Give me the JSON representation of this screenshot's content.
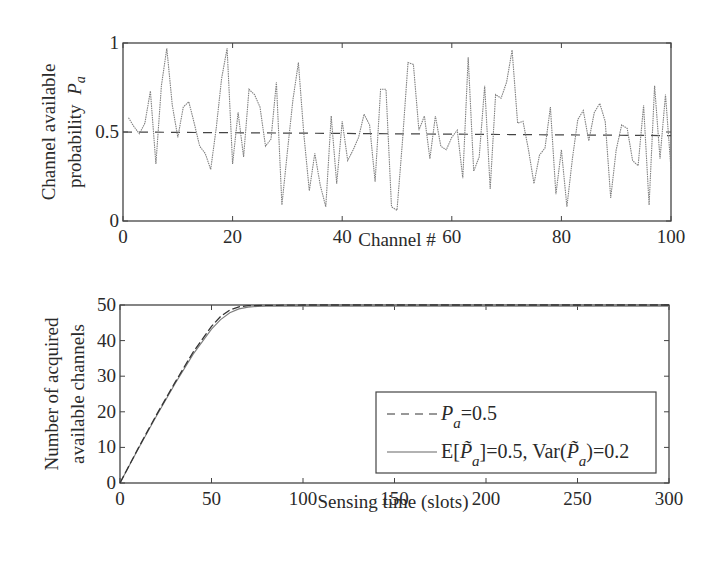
{
  "chart_data": [
    {
      "type": "line",
      "title": "",
      "xlabel": "Channel #",
      "ylabel_line1": "Channel available",
      "ylabel_line2": "probability",
      "ylabel_symbol": "P",
      "ylabel_subscript": "a",
      "xlim": [
        0,
        100
      ],
      "ylim": [
        0,
        1
      ],
      "xticks": [
        0,
        20,
        40,
        60,
        80,
        100
      ],
      "xtick_labels": [
        "0",
        "20",
        "40",
        "60",
        "80",
        "100"
      ],
      "yticks": [
        0,
        0.5,
        1
      ],
      "ytick_labels": [
        "0",
        "0.5",
        "1"
      ],
      "grid": false,
      "series": [
        {
          "name": "Random channel available probability",
          "style": "dotted",
          "color": "#7a7a7a",
          "x": [
            1,
            2,
            3,
            4,
            5,
            6,
            7,
            8,
            9,
            10,
            11,
            12,
            13,
            14,
            15,
            16,
            17,
            18,
            19,
            20,
            21,
            22,
            23,
            24,
            25,
            26,
            27,
            28,
            29,
            30,
            31,
            32,
            33,
            34,
            35,
            36,
            37,
            38,
            39,
            40,
            41,
            42,
            43,
            44,
            45,
            46,
            47,
            48,
            49,
            50,
            51,
            52,
            53,
            54,
            55,
            56,
            57,
            58,
            59,
            60,
            61,
            62,
            63,
            64,
            65,
            66,
            67,
            68,
            69,
            70,
            71,
            72,
            73,
            74,
            75,
            76,
            77,
            78,
            79,
            80,
            81,
            82,
            83,
            84,
            85,
            86,
            87,
            88,
            89,
            90,
            91,
            92,
            93,
            94,
            95,
            96,
            97,
            98,
            99,
            100
          ],
          "values": [
            0.58,
            0.53,
            0.49,
            0.55,
            0.73,
            0.32,
            0.76,
            0.97,
            0.65,
            0.47,
            0.64,
            0.67,
            0.55,
            0.42,
            0.38,
            0.29,
            0.52,
            0.8,
            0.97,
            0.32,
            0.61,
            0.36,
            0.74,
            0.71,
            0.64,
            0.42,
            0.46,
            0.78,
            0.09,
            0.39,
            0.68,
            0.89,
            0.49,
            0.17,
            0.38,
            0.2,
            0.08,
            0.59,
            0.21,
            0.56,
            0.34,
            0.4,
            0.47,
            0.6,
            0.54,
            0.22,
            0.74,
            0.74,
            0.08,
            0.06,
            0.45,
            0.89,
            0.88,
            0.51,
            0.59,
            0.35,
            0.59,
            0.42,
            0.4,
            0.47,
            0.51,
            0.24,
            0.92,
            0.28,
            0.36,
            0.76,
            0.18,
            0.71,
            0.69,
            0.78,
            0.96,
            0.55,
            0.56,
            0.4,
            0.21,
            0.37,
            0.41,
            0.64,
            0.15,
            0.4,
            0.08,
            0.35,
            0.57,
            0.62,
            0.45,
            0.61,
            0.66,
            0.56,
            0.13,
            0.4,
            0.54,
            0.52,
            0.34,
            0.31,
            0.65,
            0.09,
            0.76,
            0.35,
            0.71,
            0.29
          ]
        },
        {
          "name": "Mean P_a = 0.5",
          "style": "dashed",
          "color": "#444444",
          "x": [
            0,
            100
          ],
          "values": [
            0.5,
            0.48
          ]
        }
      ]
    },
    {
      "type": "line",
      "title": "",
      "xlabel": "Sensing time (slots)",
      "ylabel_line1": "Number of acquired",
      "ylabel_line2": "available channels",
      "xlim": [
        0,
        300
      ],
      "ylim": [
        0,
        50
      ],
      "xticks": [
        0,
        50,
        100,
        150,
        200,
        250,
        300
      ],
      "xtick_labels": [
        "0",
        "50",
        "100",
        "150",
        "200",
        "250",
        "300"
      ],
      "yticks": [
        0,
        10,
        20,
        30,
        40,
        50
      ],
      "ytick_labels": [
        "0",
        "10",
        "20",
        "30",
        "40",
        "50"
      ],
      "grid": false,
      "legend_position": "lower right",
      "legend": [
        {
          "label_prefix": "P",
          "label_sub": "a",
          "label_suffix": "=0.5",
          "style": "dashed"
        },
        {
          "label_prefix": "E[",
          "label_sym": "P̃",
          "label_sub": "a",
          "label_mid": "]=0.5, Var(",
          "label_sym2": "P̃",
          "label_sub2": "a",
          "label_suffix": ")=0.2",
          "style": "solid"
        }
      ],
      "series": [
        {
          "name": "P_a=0.5",
          "style": "dashed",
          "color": "#333333",
          "x": [
            0,
            10,
            20,
            30,
            40,
            50,
            55,
            60,
            65,
            70,
            80,
            100,
            150,
            200,
            250,
            300
          ],
          "values": [
            0,
            9.8,
            19.2,
            28.2,
            36.8,
            44.0,
            46.8,
            48.6,
            49.5,
            49.8,
            49.9,
            50,
            50,
            50,
            50,
            50
          ]
        },
        {
          "name": "E[P̃_a]=0.5, Var(P̃_a)=0.2",
          "style": "solid",
          "color": "#777777",
          "x": [
            0,
            10,
            20,
            30,
            40,
            50,
            55,
            60,
            65,
            70,
            75,
            80,
            100,
            150,
            200,
            250,
            300
          ],
          "values": [
            0,
            9.6,
            18.9,
            27.8,
            36.2,
            43.2,
            45.9,
            47.8,
            48.9,
            49.4,
            49.6,
            49.7,
            49.7,
            49.7,
            49.7,
            49.7,
            49.7
          ]
        }
      ]
    }
  ]
}
